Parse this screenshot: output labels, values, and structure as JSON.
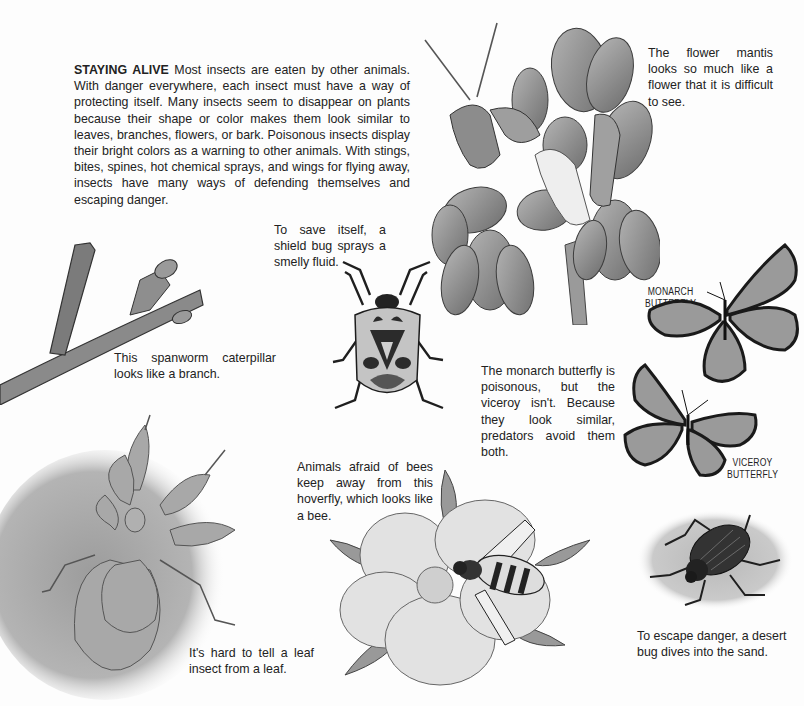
{
  "intro": {
    "heading": "STAYING ALIVE",
    "body": "Most insects are eaten by other animals. With danger everywhere, each insect must have a way of protecting itself. Many insects seem to disappear on plants because their shape or color makes them look similar to leaves, branches, flowers, or bark. Poisonous insects display their bright colors as a warning to other animals. With stings, bites, spines, hot chemical sprays, and wings for flying away, insects have many ways of defending themselves and escaping danger."
  },
  "captions": {
    "flower_mantis": "The flower mantis looks so much like a flower that it is difficult to see.",
    "shield_bug": "To save itself, a shield bug sprays a smelly fluid.",
    "spanworm": "This spanworm caterpillar looks like a branch.",
    "butterflies": "The monarch butterfly is poisonous, but the viceroy isn't. Because they look similar, predators avoid them both.",
    "hoverfly": "Animals afraid of bees keep away from this hoverfly, which looks like a bee.",
    "leaf_insect": "It's hard to tell a leaf insect from a leaf.",
    "desert_bug": "To escape danger, a desert bug dives into the sand."
  },
  "labels": {
    "monarch_line1": "MONARCH",
    "monarch_line2": "BUTTERFLY",
    "viceroy_line1": "VICEROY",
    "viceroy_line2": "BUTTERFLY"
  },
  "illustrations": [
    {
      "name": "flower mantis on flower stalk"
    },
    {
      "name": "spanworm caterpillar on branch"
    },
    {
      "name": "shield bug"
    },
    {
      "name": "monarch butterfly"
    },
    {
      "name": "viceroy butterfly"
    },
    {
      "name": "leaf insect"
    },
    {
      "name": "hoverfly on flower"
    },
    {
      "name": "desert bug on sand"
    }
  ],
  "colors": {
    "background": "#fdfdfd",
    "text": "#222222",
    "illustration_mid": "#8a8a8a",
    "illustration_dark": "#2a2a2a"
  }
}
